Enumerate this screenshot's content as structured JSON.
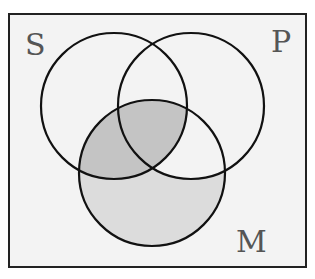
{
  "diagram": {
    "type": "venn",
    "sets": [
      {
        "name": "S",
        "label": "S"
      },
      {
        "name": "P",
        "label": "P"
      },
      {
        "name": "M",
        "label": "M"
      }
    ],
    "shaded_regions": [
      "S∩M (outside P)",
      "S∩P∩M",
      "M only"
    ],
    "unshaded_regions_of_M": [
      "P∩M (outside S)"
    ],
    "colors": {
      "background": "#f3f3f3",
      "border": "#222222",
      "circle_stroke": "#111111",
      "shade_dark": "#c4c4c4",
      "shade_light": "#dcdcdc",
      "label": "#555555"
    }
  }
}
